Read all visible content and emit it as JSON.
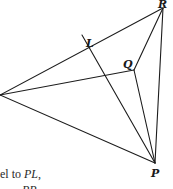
{
  "diagram": {
    "points": {
      "R": {
        "label": "R",
        "x": 163,
        "y": 8,
        "label_x": 158,
        "label_y": 8
      },
      "L": {
        "label": "L",
        "x": 90,
        "y": 48,
        "label_x": 86,
        "label_y": 47
      },
      "Q": {
        "label": "Q",
        "x": 134,
        "y": 70,
        "label_x": 123,
        "label_y": 68
      },
      "P": {
        "label": "P",
        "x": 155,
        "y": 163,
        "label_x": 151,
        "label_y": 177
      },
      "A": {
        "label": "",
        "x": 0,
        "y": 95
      }
    },
    "segments": [
      {
        "from": "A",
        "to": "R"
      },
      {
        "from": "A",
        "to": "Q"
      },
      {
        "from": "A",
        "to": "P"
      },
      {
        "from": "R",
        "to": "Q"
      },
      {
        "from": "R",
        "to": "P"
      },
      {
        "from": "Q",
        "to": "P"
      },
      {
        "from": "L_ext",
        "to": "P"
      }
    ],
    "line_L_ext": {
      "x": 82,
      "y": 35
    }
  },
  "caption": {
    "line1_prefix": "el to ",
    "line1_var": "PL",
    "line1_suffix": ",",
    "line2_fragment": "PP"
  }
}
